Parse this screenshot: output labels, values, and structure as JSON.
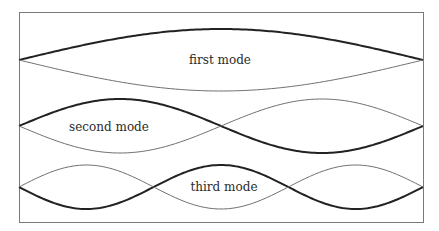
{
  "diagram": {
    "type": "standing-wave-modes",
    "frame": {
      "x": 19,
      "y": 12,
      "width": 404,
      "height": 210
    },
    "colors": {
      "thick_curve": "#222222",
      "thin_curve": "#6e6e6e",
      "frame": "#7a7a7a",
      "text": "#2a2a2a"
    },
    "modes": [
      {
        "name": "first mode",
        "label": "first mode",
        "harmonic": 1,
        "axis_y": 60,
        "amplitude": 31,
        "label_position": {
          "x": 220,
          "y": 64
        }
      },
      {
        "name": "second mode",
        "label": "second mode",
        "harmonic": 2,
        "axis_y": 126,
        "amplitude": 27,
        "label_position": {
          "x": 109,
          "y": 131
        }
      },
      {
        "name": "third mode",
        "label": "third mode",
        "harmonic": 3,
        "axis_y": 187,
        "amplitude": 22,
        "label_position": {
          "x": 224,
          "y": 191
        }
      }
    ]
  }
}
